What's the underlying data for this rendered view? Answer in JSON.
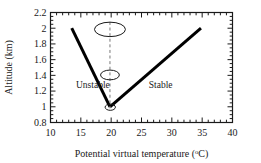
{
  "chart_data": {
    "type": "line",
    "title": "",
    "xlabel": "Potential virtual temperature (°C)",
    "xlabel_main": "Potential virtual temperature (",
    "xlabel_sup": "o",
    "xlabel_tail": "C)",
    "ylabel": "Altitude (km)",
    "xlim": [
      10,
      40
    ],
    "ylim": [
      0.8,
      2.2
    ],
    "xticks": [
      10,
      15,
      20,
      25,
      30,
      35,
      40
    ],
    "xtick_labels": [
      "10",
      "15",
      "20",
      "25",
      "30",
      "35",
      "40"
    ],
    "x_minor_tick_step": 1,
    "yticks": [
      0.8,
      1.0,
      1.2,
      1.4,
      1.6,
      1.8,
      2.0,
      2.2
    ],
    "ytick_labels": [
      "0.8",
      "1",
      "1.2",
      "1.4",
      "1.6",
      "1.8",
      "2",
      "2.2"
    ],
    "y_minor_tick_step": 0.05,
    "grid": false,
    "legend": "none",
    "series": [
      {
        "name": "Unstable branch",
        "style": "solid",
        "color": "#000000",
        "width": 3,
        "x": [
          13.5,
          19.8
        ],
        "y": [
          2.0,
          1.0
        ]
      },
      {
        "name": "Stable branch",
        "style": "solid",
        "color": "#000000",
        "width": 3,
        "x": [
          19.8,
          34.8
        ],
        "y": [
          1.0,
          2.0
        ]
      },
      {
        "name": "Parcel path",
        "style": "dashed",
        "color": "#777777",
        "width": 1,
        "x": [
          19.8,
          19.8
        ],
        "y": [
          2.08,
          0.98
        ]
      }
    ],
    "annotations": [
      {
        "name": "unstable-region-label",
        "text": "Unstable",
        "x": 14.2,
        "y": 1.24
      },
      {
        "name": "stable-region-label",
        "text": "Stable",
        "x": 26.2,
        "y": 1.24
      }
    ],
    "ellipses": [
      {
        "name": "parcel-top",
        "cx": 19.8,
        "cy": 1.985,
        "rx": 2.55,
        "ry": 0.092
      },
      {
        "name": "parcel-middle",
        "cx": 19.8,
        "cy": 1.405,
        "rx": 1.55,
        "ry": 0.062
      },
      {
        "name": "parcel-bottom",
        "cx": 19.85,
        "cy": 0.995,
        "rx": 0.85,
        "ry": 0.04
      }
    ],
    "colors": {
      "line": "#000000",
      "dashed": "#777777",
      "axis": "#1a1a1a",
      "background": "#ffffff",
      "text": "#1a1a1a"
    }
  }
}
